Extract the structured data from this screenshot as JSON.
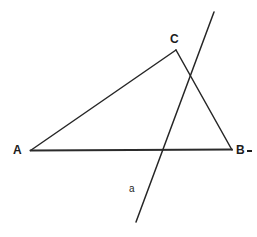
{
  "figure": {
    "kind": "geometry-diagram",
    "background_color": "#ffffff",
    "stroke_color": "#262626",
    "label_color": "#1c1c1c",
    "width": 257,
    "height": 237
  },
  "labels": {
    "vertex_a": "A",
    "vertex_c": "C",
    "vertex_b": "B",
    "line_a": "a"
  },
  "chart_data": {
    "type": "scatter",
    "xlabel": "",
    "ylabel": "",
    "xlim": [
      0,
      257
    ],
    "ylim": [
      237,
      0
    ],
    "grid": false,
    "legend": "none",
    "points": [
      {
        "name": "A",
        "x": 30,
        "y": 150,
        "label": "A"
      },
      {
        "name": "C",
        "x": 176,
        "y": 50,
        "label": "C"
      },
      {
        "name": "B",
        "x": 232,
        "y": 150,
        "label": "B"
      }
    ],
    "series": [
      {
        "name": "side-AC",
        "type": "segment",
        "from": [
          30,
          150
        ],
        "to": [
          176,
          50
        ]
      },
      {
        "name": "side-CB",
        "type": "segment",
        "from": [
          176,
          50
        ],
        "to": [
          232,
          150
        ]
      },
      {
        "name": "side-AB",
        "type": "segment",
        "from": [
          30,
          150
        ],
        "to": [
          232,
          150
        ]
      },
      {
        "name": "transversal-a",
        "type": "segment",
        "from": [
          214,
          12
        ],
        "to": [
          136,
          222
        ],
        "label": "a"
      }
    ],
    "annotations": [
      {
        "text": "A",
        "x": 18,
        "y": 150
      },
      {
        "text": "C",
        "x": 173,
        "y": 40
      },
      {
        "text": "B",
        "x": 238,
        "y": 150
      },
      {
        "text": "a",
        "x": 133,
        "y": 190
      }
    ],
    "intersections": [
      {
        "of": [
          "transversal-a",
          "side-CB"
        ],
        "x": 192,
        "y": 78
      },
      {
        "of": [
          "transversal-a",
          "side-AB"
        ],
        "x": 163,
        "y": 150
      }
    ]
  }
}
